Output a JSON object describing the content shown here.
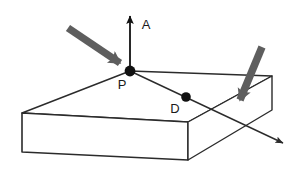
{
  "figure": {
    "canvas": {
      "width": 302,
      "height": 172
    },
    "background_color": "#ffffff",
    "line_color": "#2b2b2b",
    "arrow_color": "#5e5e5e",
    "point_color": "#111111",
    "label_color": "#1a1a1a"
  },
  "labels": {
    "normal": "A",
    "entry_point": "P",
    "interior_point": "D"
  },
  "points": {
    "entry_point": {
      "name": "P",
      "x": 130,
      "y": 71
    },
    "interior_point": {
      "name": "D",
      "x": 186,
      "y": 97
    }
  },
  "normal_axis": {
    "name": "A",
    "from": {
      "x": 130,
      "y": 71
    },
    "to": {
      "x": 130,
      "y": 12
    },
    "label_position": {
      "x": 146,
      "y": 25
    }
  },
  "incident_arrow": {
    "name": "incident-ray",
    "from": {
      "x": 68,
      "y": 28
    },
    "to": {
      "x": 126,
      "y": 68
    },
    "color": "#5e5e5e"
  },
  "exit_arrow": {
    "name": "exit-ray",
    "from": {
      "x": 262,
      "y": 47
    },
    "to": {
      "x": 238,
      "y": 110
    },
    "color": "#5e5e5e"
  },
  "refracted_ray": {
    "name": "refracted-ray",
    "from": {
      "x": 130,
      "y": 71
    },
    "to": {
      "x": 288,
      "y": 146
    },
    "color": "#2b2b2b"
  },
  "slab": {
    "name": "rectangular-slab",
    "top_face": [
      {
        "x": 130,
        "y": 71
      },
      {
        "x": 272,
        "y": 76
      },
      {
        "x": 188,
        "y": 122
      },
      {
        "x": 22,
        "y": 113
      }
    ],
    "front_face": [
      {
        "x": 22,
        "y": 113
      },
      {
        "x": 188,
        "y": 122
      },
      {
        "x": 188,
        "y": 160
      },
      {
        "x": 22,
        "y": 152
      }
    ],
    "right_face": [
      {
        "x": 188,
        "y": 122
      },
      {
        "x": 272,
        "y": 76
      },
      {
        "x": 272,
        "y": 110
      },
      {
        "x": 188,
        "y": 160
      }
    ]
  }
}
